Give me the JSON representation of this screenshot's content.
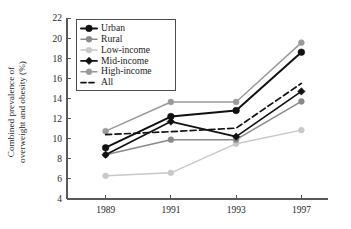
{
  "chart_data": {
    "type": "line",
    "title": "",
    "xlabel": "",
    "ylabel": "Combined prevalence of overweight and obesity (%)",
    "ylabel_line1": "Combined prevalence of",
    "ylabel_line2": "overweight and obesity (%)",
    "categories": [
      "1989",
      "1991",
      "1993",
      "1997"
    ],
    "x": [
      1989,
      1991,
      1993,
      1997
    ],
    "ylim": [
      4,
      22
    ],
    "ytick_labels": [
      "4",
      "6",
      "8",
      "10",
      "12",
      "14",
      "16",
      "18",
      "20",
      "22"
    ],
    "yticks": [
      4,
      6,
      8,
      10,
      12,
      14,
      16,
      18,
      20,
      22
    ],
    "grid": false,
    "legend_position": "upper-left-inside",
    "series": [
      {
        "name": "Urban",
        "values": [
          9.1,
          12.2,
          12.8,
          18.6
        ],
        "color": "#111111",
        "style": "solid",
        "marker": "circle",
        "line_width": 2.0,
        "marker_size": 3.3
      },
      {
        "name": "Rural",
        "values": [
          8.4,
          9.9,
          9.9,
          13.7
        ],
        "color": "#8a8a8a",
        "style": "solid",
        "marker": "circle",
        "line_width": 1.5,
        "marker_size": 2.9
      },
      {
        "name": "Low-income",
        "values": [
          6.3,
          6.6,
          9.5,
          10.85
        ],
        "color": "#c8c8c8",
        "style": "solid",
        "marker": "circle",
        "line_width": 1.5,
        "marker_size": 2.9
      },
      {
        "name": "Mid-income",
        "values": [
          8.4,
          11.7,
          10.2,
          14.7
        ],
        "color": "#111111",
        "style": "solid",
        "marker": "diamond",
        "line_width": 1.7,
        "marker_size": 3.2
      },
      {
        "name": "High-income",
        "values": [
          10.75,
          13.65,
          13.65,
          19.55
        ],
        "color": "#9a9a9a",
        "style": "solid",
        "marker": "circle",
        "line_width": 1.5,
        "marker_size": 2.9
      },
      {
        "name": "All",
        "values": [
          10.4,
          10.7,
          11.05,
          15.5
        ],
        "color": "#111111",
        "style": "dashed",
        "marker": "none",
        "line_width": 1.7,
        "marker_size": 0
      }
    ]
  },
  "legend": {
    "entries": [
      {
        "label": "Urban"
      },
      {
        "label": "Rural"
      },
      {
        "label": "Low-income"
      },
      {
        "label": "Mid-income"
      },
      {
        "label": "High-income"
      },
      {
        "label": "All"
      }
    ]
  },
  "colors": {
    "axis": "#595959",
    "text": "#1a1a1a",
    "background": "#ffffff"
  }
}
